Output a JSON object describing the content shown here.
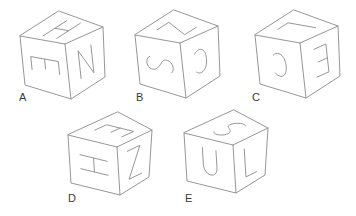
{
  "figure": {
    "type": "spatial-reasoning-cubes",
    "background": "#ffffff",
    "line_color": "#979797",
    "label_color": "#3a3a3a",
    "cubes": [
      {
        "label": "A",
        "faces": {
          "top": {
            "letter": "H",
            "rotation": 0
          },
          "left": {
            "letter": "E",
            "rotation": 90
          },
          "right": {
            "letter": "N",
            "rotation": 0
          }
        }
      },
      {
        "label": "B",
        "faces": {
          "top": {
            "letter": "Z",
            "rotation": 90
          },
          "left": {
            "letter": "S",
            "rotation": 90
          },
          "right": {
            "letter": "C",
            "rotation": 180
          }
        }
      },
      {
        "label": "C",
        "faces": {
          "top": {
            "letter": "L",
            "rotation": 90
          },
          "left": {
            "letter": "C",
            "rotation": 180
          },
          "right": {
            "letter": "E",
            "rotation": 180
          }
        }
      },
      {
        "label": "D",
        "faces": {
          "top": {
            "letter": "E",
            "rotation": 90
          },
          "left": {
            "letter": "H",
            "rotation": 90
          },
          "right": {
            "letter": "Z",
            "rotation": 0
          }
        }
      },
      {
        "label": "E",
        "faces": {
          "top": {
            "letter": "S",
            "rotation": 0
          },
          "left": {
            "letter": "U",
            "rotation": 0
          },
          "right": {
            "letter": "L",
            "rotation": 0
          }
        }
      }
    ]
  }
}
